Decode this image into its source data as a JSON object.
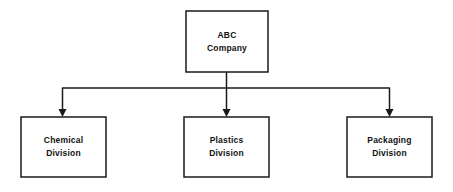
{
  "diagram": {
    "type": "organizational-chart",
    "background_color": "#ffffff",
    "line_color": "#1a1a1a",
    "text_color": "#111111",
    "root": {
      "id": "abc-company",
      "line1": "ABC",
      "line2": "Company"
    },
    "children": [
      {
        "id": "chemical-division",
        "line1": "Chemical",
        "line2": "Division"
      },
      {
        "id": "plastics-division",
        "line1": "Plastics",
        "line2": "Division"
      },
      {
        "id": "packaging-division",
        "line1": "Packaging",
        "line2": "Division"
      }
    ]
  }
}
